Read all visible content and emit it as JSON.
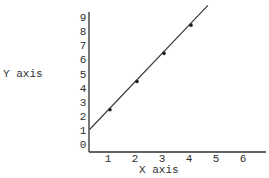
{
  "chart_data": {
    "type": "line",
    "title": "",
    "xlabel": "X axis",
    "ylabel": "Y axis",
    "x_ticks": [
      "1",
      "2",
      "3",
      "4",
      "5",
      "6"
    ],
    "y_ticks": [
      "0",
      "1",
      "2",
      "3",
      "4",
      "5",
      "6",
      "7",
      "8",
      "9"
    ],
    "xlim": [
      0,
      6.5
    ],
    "ylim": [
      0,
      9.5
    ],
    "grid": false,
    "legend": null,
    "series": [
      {
        "name": "line",
        "x": [
          1,
          2,
          3,
          4
        ],
        "y": [
          2.5,
          4.5,
          6.5,
          8.5
        ],
        "markers": true,
        "fit": "y = 2x + 0.5",
        "line_extent": {
          "x_start": 0.3,
          "y_start": 1.1,
          "x_end": 4.7,
          "y_end": 9.9
        }
      }
    ],
    "colors": {
      "axis": "#2f2f2f",
      "line": "#3a3a3a",
      "marker": "#1e1e1e"
    }
  }
}
